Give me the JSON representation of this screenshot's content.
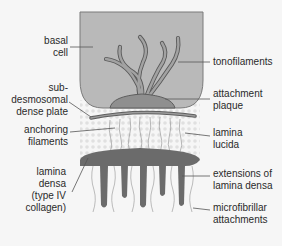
{
  "colors": {
    "background": "#f6f6f6",
    "cell_fill": "#b8b8b8",
    "cell_stroke": "#7a7a7a",
    "plaque_fill": "#8e8e8e",
    "filament_fill": "#a0a0a0",
    "filament_stroke": "#5e5e5e",
    "lamina_densa": "#6a6a6a",
    "lamina_lucida_dots": "#dedede",
    "anchoring_filament": "#9a9a9a",
    "leader_line": "#555555",
    "text": "#2a2a2a"
  },
  "labels": {
    "basal_cell": [
      "basal",
      "cell"
    ],
    "sub_desmosomal_dense_plate": [
      "sub-",
      "desmosomal",
      "dense plate"
    ],
    "anchoring_filaments": [
      "anchoring",
      "filaments"
    ],
    "lamina_densa": [
      "lamina",
      "densa",
      "(type IV",
      "collagen)"
    ],
    "tonofilaments": [
      "tonofilaments"
    ],
    "attachment_plaque": [
      "attachment",
      "plaque"
    ],
    "lamina_lucida": [
      "lamina",
      "lucida"
    ],
    "extensions_of_lamina_densa": [
      "extensions of",
      "lamina densa"
    ],
    "microfibrillar_attachments": [
      "microfibrillar",
      "attachments"
    ]
  }
}
